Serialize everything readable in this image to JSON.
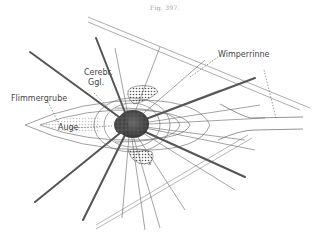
{
  "figure": {
    "title": "Fig. 397.",
    "labels": {
      "cerebral_ganglion_line1": "Cerebr.",
      "cerebral_ganglion_line2": "Ggl.",
      "ciliated_pit": "Flimmergrube",
      "eye": "Auge",
      "ciliated_groove": "Wimperrinne",
      "x_marker": "x"
    }
  }
}
